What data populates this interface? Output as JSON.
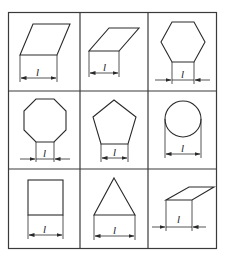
{
  "diagram": {
    "title": "",
    "grid": {
      "rows": 3,
      "cols": 3
    },
    "dimension_label": "l",
    "cells": [
      {
        "row": 1,
        "col": 1,
        "shape": "parallelogram-tall",
        "label": "l"
      },
      {
        "row": 1,
        "col": 2,
        "shape": "parallelogram-flat",
        "label": "l"
      },
      {
        "row": 1,
        "col": 3,
        "shape": "hexagon",
        "label": "l"
      },
      {
        "row": 2,
        "col": 1,
        "shape": "octagon",
        "label": "l"
      },
      {
        "row": 2,
        "col": 2,
        "shape": "pentagon",
        "label": "l"
      },
      {
        "row": 2,
        "col": 3,
        "shape": "circle",
        "label": "l"
      },
      {
        "row": 3,
        "col": 1,
        "shape": "square",
        "label": "l"
      },
      {
        "row": 3,
        "col": 2,
        "shape": "triangle",
        "label": "l"
      },
      {
        "row": 3,
        "col": 3,
        "shape": "parallelogram-flat-small",
        "label": "l"
      }
    ]
  }
}
